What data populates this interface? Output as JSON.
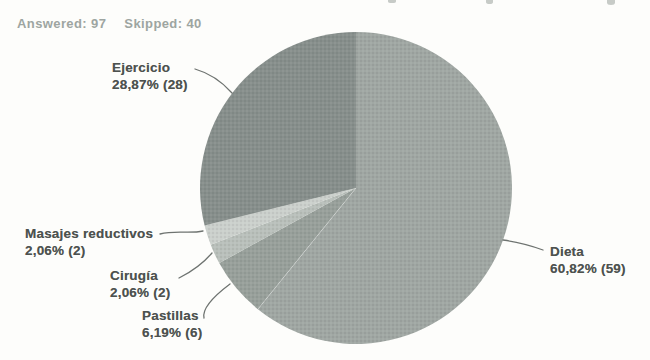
{
  "header": {
    "answered_label": "Answered:",
    "answered_value": "97",
    "skipped_label": "Skipped:",
    "skipped_value": "40"
  },
  "chart_data": {
    "type": "pie",
    "title": "",
    "answered": 97,
    "skipped": 40,
    "categories": [
      "Dieta",
      "Pastillas",
      "Cirugía",
      "Masajes reductivos",
      "Ejercicio"
    ],
    "values": [
      59,
      6,
      2,
      2,
      28
    ],
    "percents": [
      60.82,
      6.19,
      2.06,
      2.06,
      28.87
    ],
    "percent_labels": [
      "60,82%",
      "6,19%",
      "2,06%",
      "2,06%",
      "28,87%"
    ],
    "colors": [
      "#a0a7a3",
      "#98a09b",
      "#b9c0bb",
      "#cbd0cc",
      "#878f8c"
    ],
    "start_angle_deg": 0,
    "direction": "clockwise",
    "legend": "callout-labels-with-leader-lines",
    "text_color": "#4d524f",
    "leader_line_color": "#6e7370"
  },
  "callouts": {
    "ejercicio": {
      "label": "Ejercicio",
      "value": "28,87% (28)"
    },
    "masajes": {
      "label": "Masajes reductivos",
      "value": "2,06% (2)"
    },
    "cirugia": {
      "label": "Cirugía",
      "value": "2,06% (2)"
    },
    "pastillas": {
      "label": "Pastillas",
      "value": "6,19% (6)"
    },
    "dieta": {
      "label": "Dieta",
      "value": "60,82% (59)"
    }
  }
}
